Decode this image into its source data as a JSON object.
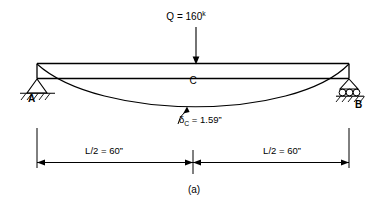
{
  "figure": {
    "caption": "(a)",
    "type": "simply-supported-beam-deflection-diagram"
  },
  "load": {
    "symbol": "Q",
    "equals": " = ",
    "magnitude": "160",
    "unit_superscript": "k",
    "full_label": "Q = 160k",
    "arrow_direction": "down"
  },
  "beam": {
    "midpoint_label": "C",
    "left_support_label": "A",
    "right_support_label": "B",
    "left_support_type": "pin",
    "right_support_type": "roller"
  },
  "deflection": {
    "symbol": "δ",
    "subscript": "C",
    "equals": " = ",
    "value": "1.59”",
    "full_label": "δC = 1.59”"
  },
  "dimensions": {
    "left": "L/2 = 60”",
    "right": "L/2 = 60”"
  },
  "colors": {
    "line": "#000000",
    "background": "#ffffff"
  }
}
